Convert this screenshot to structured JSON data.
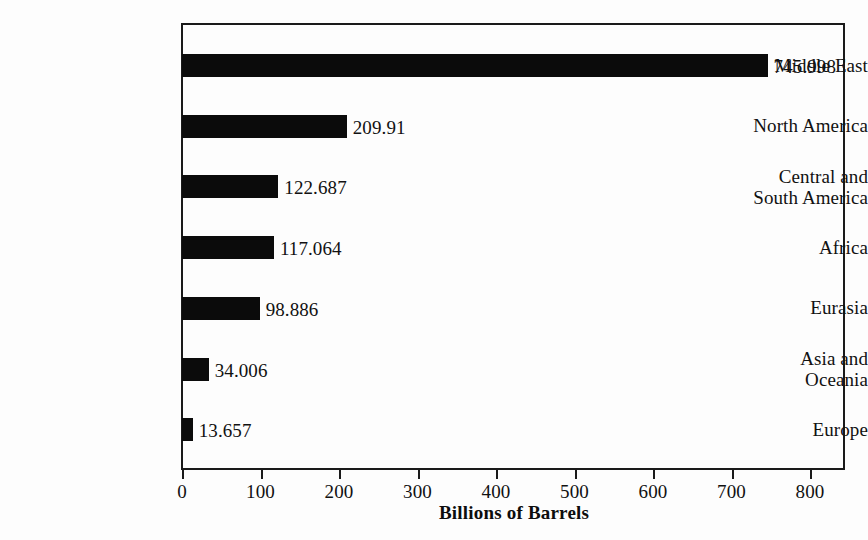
{
  "chart_data": {
    "type": "bar",
    "orientation": "horizontal",
    "title": "",
    "xlabel": "Billions of Barrels",
    "ylabel": "",
    "xlim": [
      0,
      800
    ],
    "xticks": [
      0,
      100,
      200,
      300,
      400,
      500,
      600,
      700,
      800
    ],
    "xtick_labels": [
      "0",
      "100",
      "200",
      "300",
      "400",
      "500",
      "600",
      "700",
      "800"
    ],
    "grid": false,
    "legend": false,
    "bar_color": "#0b0b0b",
    "background_color": "#fdfdfd",
    "categories": [
      "Middle East",
      "North America",
      "Central and\nSouth America",
      "Africa",
      "Eurasia",
      "Asia and\nOceania",
      "Europe"
    ],
    "values": [
      745.998,
      209.91,
      122.687,
      117.064,
      98.886,
      34.006,
      13.657
    ],
    "value_labels": [
      "745.998",
      "209.91",
      "122.687",
      "117.064",
      "98.886",
      "34.006",
      "13.657"
    ]
  },
  "axis": {
    "x_title": "Billions of Barrels",
    "ticks": [
      {
        "label": "0"
      },
      {
        "label": "100"
      },
      {
        "label": "200"
      },
      {
        "label": "300"
      },
      {
        "label": "400"
      },
      {
        "label": "500"
      },
      {
        "label": "600"
      },
      {
        "label": "700"
      },
      {
        "label": "800"
      }
    ]
  },
  "bars": [
    {
      "category": "Middle East",
      "value": 745.998,
      "value_label": "745.998"
    },
    {
      "category": "North America",
      "value": 209.91,
      "value_label": "209.91"
    },
    {
      "category": "Central and\nSouth America",
      "value": 122.687,
      "value_label": "122.687"
    },
    {
      "category": "Africa",
      "value": 117.064,
      "value_label": "117.064"
    },
    {
      "category": "Eurasia",
      "value": 98.886,
      "value_label": "98.886"
    },
    {
      "category": "Asia and\nOceania",
      "value": 34.006,
      "value_label": "34.006"
    },
    {
      "category": "Europe",
      "value": 13.657,
      "value_label": "13.657"
    }
  ]
}
